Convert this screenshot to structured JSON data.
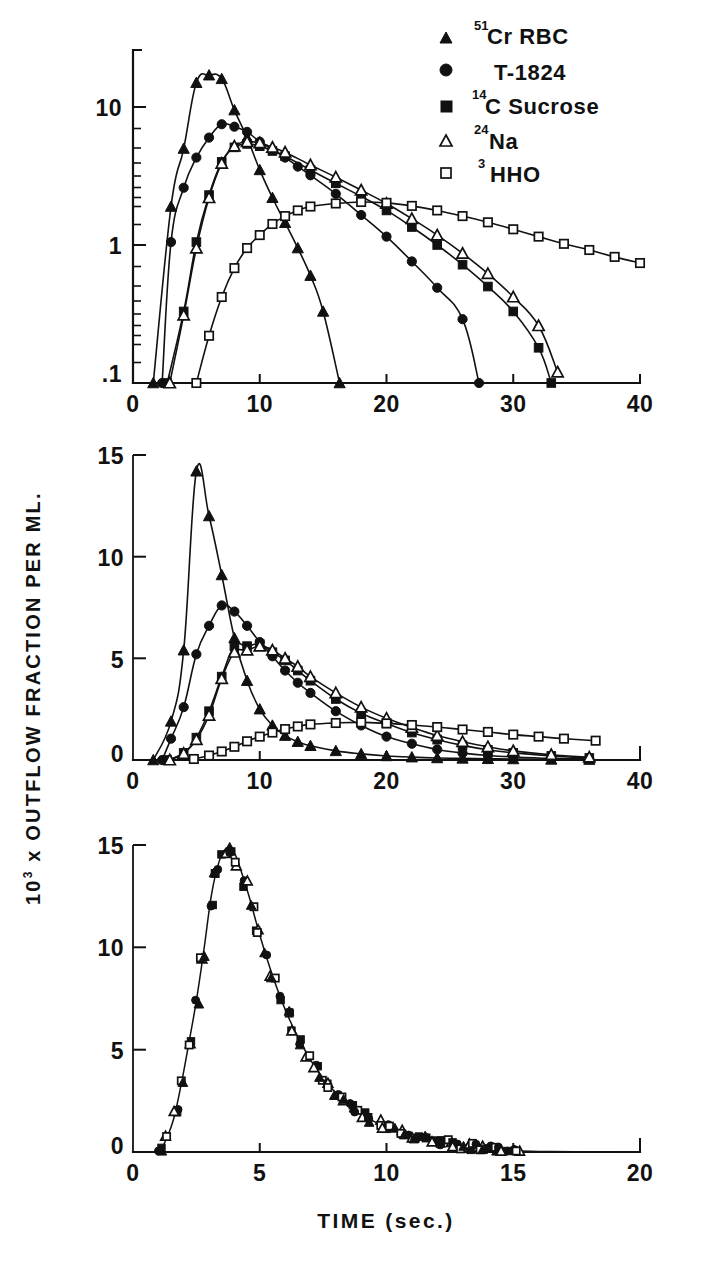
{
  "figure": {
    "kind": "indicator-dilution-curves",
    "y_axis_label_parts": {
      "coef": "10",
      "exp": "3",
      "rest": " x OUTFLOW FRACTION PER ML."
    },
    "x_axis_label": "TIME (sec.)"
  },
  "legend": {
    "position": "top-right",
    "items": [
      {
        "marker": "filled-triangle",
        "sup": "51",
        "label": "Cr  RBC"
      },
      {
        "marker": "filled-circle",
        "sup": "",
        "label": "T-1824"
      },
      {
        "marker": "filled-square",
        "sup": "14",
        "label": "C Sucrose"
      },
      {
        "marker": "open-triangle",
        "sup": "24",
        "label": "Na"
      },
      {
        "marker": "open-square",
        "sup": "3",
        "label": "HHO"
      }
    ]
  },
  "chart_data": [
    {
      "id": "panel-top",
      "type": "line",
      "title": "",
      "xlabel": "",
      "ylabel": "10^3 x OUTFLOW FRACTION PER ML.",
      "yscale": "log",
      "xlim": [
        0,
        40
      ],
      "ylim": [
        0.1,
        20
      ],
      "xticks": [
        0,
        10,
        20,
        30,
        40
      ],
      "xtick_labels": [
        "0",
        "10",
        "20",
        "30",
        "40"
      ],
      "yticks": [
        0.1,
        1,
        10
      ],
      "ytick_labels": [
        ".1",
        "1",
        "10"
      ],
      "grid": false,
      "series": [
        {
          "name": "51Cr RBC",
          "marker": "filled-triangle",
          "x": [
            1.6,
            3.0,
            4.0,
            5.0,
            6.0,
            7.0,
            8.0,
            9.0,
            10.0,
            11.0,
            12.0,
            13.0,
            14.0,
            15.0,
            16.3
          ],
          "y": [
            0.1,
            1.9,
            5.0,
            15.0,
            17.0,
            16.0,
            9.5,
            6.0,
            3.5,
            2.2,
            1.45,
            0.95,
            0.6,
            0.33,
            0.1
          ]
        },
        {
          "name": "T-1824",
          "marker": "filled-circle",
          "x": [
            2.3,
            3.0,
            4.0,
            5.0,
            6.0,
            7.0,
            8.0,
            9.0,
            10.0,
            11.0,
            12.0,
            13.0,
            14.0,
            16.0,
            18.0,
            20.0,
            22.0,
            24.0,
            26.0,
            27.3
          ],
          "y": [
            0.1,
            1.05,
            2.6,
            4.3,
            6.0,
            7.5,
            7.2,
            6.6,
            5.6,
            4.9,
            4.3,
            3.7,
            3.2,
            2.35,
            1.65,
            1.15,
            0.76,
            0.49,
            0.29,
            0.1
          ]
        },
        {
          "name": "14C Sucrose",
          "marker": "filled-square",
          "x": [
            2.7,
            4.0,
            5.0,
            6.0,
            7.0,
            8.0,
            9.0,
            10.0,
            11.0,
            12.0,
            14.0,
            16.0,
            18.0,
            20.0,
            22.0,
            24.0,
            26.0,
            28.0,
            30.0,
            32.0,
            33.0
          ],
          "y": [
            0.1,
            0.33,
            1.05,
            2.3,
            4.0,
            5.1,
            5.4,
            5.2,
            4.8,
            4.4,
            3.5,
            2.8,
            2.25,
            1.78,
            1.35,
            1.0,
            0.72,
            0.5,
            0.33,
            0.18,
            0.1
          ]
        },
        {
          "name": "24Na",
          "marker": "open-triangle",
          "x": [
            2.9,
            4.0,
            5.0,
            6.0,
            7.0,
            8.0,
            9.0,
            10.0,
            11.0,
            12.0,
            14.0,
            16.0,
            18.0,
            20.0,
            22.0,
            24.0,
            26.0,
            28.0,
            30.0,
            32.0,
            33.5
          ],
          "y": [
            0.1,
            0.31,
            0.95,
            2.2,
            3.9,
            5.2,
            5.6,
            5.5,
            5.1,
            4.7,
            3.8,
            3.1,
            2.5,
            2.0,
            1.55,
            1.18,
            0.87,
            0.62,
            0.42,
            0.26,
            0.12
          ]
        },
        {
          "name": "3HHO",
          "marker": "open-square",
          "x": [
            5.0,
            6.0,
            7.0,
            8.0,
            9.0,
            10.0,
            11.0,
            12.0,
            13.0,
            14.0,
            16.0,
            18.0,
            20.0,
            22.0,
            24.0,
            26.0,
            28.0,
            30.0,
            32.0,
            34.0,
            36.0,
            38.0,
            40.0
          ],
          "y": [
            0.1,
            0.22,
            0.42,
            0.68,
            0.95,
            1.18,
            1.42,
            1.62,
            1.78,
            1.9,
            2.0,
            2.05,
            2.02,
            1.92,
            1.78,
            1.62,
            1.46,
            1.3,
            1.15,
            1.02,
            0.92,
            0.82,
            0.74
          ]
        }
      ]
    },
    {
      "id": "panel-middle",
      "type": "line",
      "title": "",
      "xlabel": "",
      "ylabel": "10^3 x OUTFLOW FRACTION PER ML.",
      "yscale": "linear",
      "xlim": [
        0,
        40
      ],
      "ylim": [
        0,
        15
      ],
      "xticks": [
        0,
        10,
        20,
        30,
        40
      ],
      "xtick_labels": [
        "0",
        "10",
        "20",
        "30",
        "40"
      ],
      "yticks": [
        0,
        5,
        10,
        15
      ],
      "ytick_labels": [
        "0",
        "5",
        "10",
        "15"
      ],
      "grid": false,
      "series": [
        {
          "name": "51Cr RBC",
          "marker": "filled-triangle",
          "x": [
            1.6,
            3.0,
            4.0,
            5.0,
            6.0,
            7.0,
            8.0,
            9.0,
            10.0,
            11.0,
            12.0,
            13.0,
            14.0,
            16.0,
            18.0,
            20.0,
            22.0,
            24.0,
            26.0,
            28.0,
            30.0,
            33.0,
            36.0
          ],
          "y": [
            0.0,
            1.9,
            5.4,
            14.2,
            12.0,
            9.1,
            6.0,
            3.9,
            2.5,
            1.7,
            1.2,
            0.9,
            0.7,
            0.45,
            0.3,
            0.2,
            0.14,
            0.1,
            0.08,
            0.06,
            0.05,
            0.03,
            0.02
          ]
        },
        {
          "name": "T-1824",
          "marker": "filled-circle",
          "x": [
            2.3,
            3.0,
            4.0,
            5.0,
            6.0,
            7.0,
            8.0,
            9.0,
            10.0,
            11.0,
            12.0,
            13.0,
            14.0,
            16.0,
            18.0,
            20.0,
            22.0,
            24.0,
            26.0,
            28.0,
            30.0,
            33.0,
            36.0
          ],
          "y": [
            0.0,
            1.05,
            2.6,
            5.2,
            6.6,
            7.6,
            7.3,
            6.6,
            5.8,
            5.1,
            4.4,
            3.8,
            3.3,
            2.4,
            1.7,
            1.15,
            0.8,
            0.52,
            0.34,
            0.22,
            0.15,
            0.08,
            0.05
          ]
        },
        {
          "name": "14C Sucrose",
          "marker": "filled-square",
          "x": [
            2.7,
            4.0,
            5.0,
            6.0,
            7.0,
            8.0,
            9.0,
            10.0,
            11.0,
            12.0,
            13.0,
            14.0,
            16.0,
            18.0,
            20.0,
            22.0,
            24.0,
            26.0,
            28.0,
            30.0,
            33.0,
            36.0
          ],
          "y": [
            0.0,
            0.35,
            1.1,
            2.4,
            4.1,
            5.6,
            5.6,
            5.7,
            5.3,
            4.9,
            4.4,
            3.9,
            3.0,
            2.3,
            1.8,
            1.35,
            1.0,
            0.72,
            0.5,
            0.35,
            0.2,
            0.1
          ]
        },
        {
          "name": "24Na",
          "marker": "open-triangle",
          "x": [
            2.9,
            4.0,
            5.0,
            6.0,
            7.0,
            8.0,
            9.0,
            10.0,
            11.0,
            12.0,
            13.0,
            14.0,
            16.0,
            18.0,
            20.0,
            22.0,
            24.0,
            26.0,
            28.0,
            30.0,
            33.0,
            36.0
          ],
          "y": [
            0.0,
            0.32,
            1.0,
            2.2,
            4.0,
            5.3,
            5.4,
            5.6,
            5.4,
            5.0,
            4.6,
            4.1,
            3.3,
            2.6,
            2.05,
            1.6,
            1.2,
            0.9,
            0.65,
            0.45,
            0.26,
            0.14
          ]
        },
        {
          "name": "3HHO",
          "marker": "open-square",
          "x": [
            4.8,
            6.0,
            7.0,
            8.0,
            9.0,
            10.0,
            11.0,
            12.0,
            13.0,
            14.0,
            16.0,
            18.0,
            20.0,
            22.0,
            24.0,
            26.0,
            28.0,
            30.0,
            32.0,
            34.0,
            36.5
          ],
          "y": [
            0.05,
            0.22,
            0.42,
            0.65,
            0.92,
            1.15,
            1.35,
            1.52,
            1.65,
            1.75,
            1.82,
            1.85,
            1.8,
            1.72,
            1.62,
            1.5,
            1.38,
            1.25,
            1.15,
            1.05,
            0.95
          ]
        }
      ]
    },
    {
      "id": "panel-bottom",
      "type": "scatter",
      "title": "",
      "xlabel": "TIME (sec.)",
      "ylabel": "10^3 x OUTFLOW FRACTION PER ML.",
      "yscale": "linear",
      "xlim": [
        0,
        20
      ],
      "ylim": [
        0,
        15
      ],
      "xticks": [
        0,
        5,
        10,
        15,
        20
      ],
      "xtick_labels": [
        "0",
        "5",
        "10",
        "15",
        "20"
      ],
      "yticks": [
        0,
        5,
        10,
        15
      ],
      "ytick_labels": [
        "0",
        "5",
        "10",
        "15"
      ],
      "grid": false,
      "note": "all five tracers superimpose on one common curve",
      "common_curve": {
        "x": [
          1.1,
          1.3,
          1.6,
          1.9,
          2.2,
          2.5,
          2.8,
          3.1,
          3.4,
          3.7,
          4.0,
          4.3,
          4.6,
          5.0,
          5.4,
          5.8,
          6.2,
          6.6,
          7.0,
          7.5,
          8.0,
          8.5,
          9.0,
          9.5,
          10.0,
          10.6,
          11.2,
          11.8,
          12.4,
          13.0,
          13.6,
          14.2,
          15.0,
          16.0,
          17.5,
          19.0
        ],
        "y": [
          0.1,
          0.6,
          1.6,
          3.3,
          5.3,
          7.4,
          9.9,
          12.6,
          14.2,
          14.85,
          14.6,
          13.6,
          12.4,
          10.6,
          9.0,
          7.6,
          6.4,
          5.4,
          4.5,
          3.6,
          2.9,
          2.3,
          1.85,
          1.5,
          1.2,
          0.95,
          0.75,
          0.6,
          0.45,
          0.32,
          0.22,
          0.12,
          0.06,
          0.03,
          0.015,
          0.0
        ]
      },
      "series": [
        {
          "name": "51Cr RBC",
          "marker": "filled-triangle"
        },
        {
          "name": "T-1824",
          "marker": "filled-circle"
        },
        {
          "name": "14C Sucrose",
          "marker": "filled-square"
        },
        {
          "name": "24Na",
          "marker": "open-triangle"
        },
        {
          "name": "3HHO",
          "marker": "open-square"
        }
      ]
    }
  ]
}
